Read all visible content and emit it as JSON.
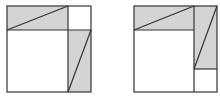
{
  "diagram": {
    "colors": {
      "stroke": "#333333",
      "shade": "#d4d4d4",
      "background": "#ffffff"
    },
    "figures": [
      {
        "name": "left-figure",
        "outer": {
          "x": 7,
          "y": 6,
          "w": 84,
          "h": 86
        },
        "shaded_rects": [
          {
            "x": 7,
            "y": 6,
            "w": 61,
            "h": 24
          },
          {
            "x": 68,
            "y": 30,
            "w": 23,
            "h": 62
          }
        ],
        "lines": [
          {
            "x1": 7,
            "y1": 30,
            "x2": 91,
            "y2": 30
          },
          {
            "x1": 68,
            "y1": 6,
            "x2": 68,
            "y2": 92
          },
          {
            "x1": 7,
            "y1": 30,
            "x2": 68,
            "y2": 6
          },
          {
            "x1": 68,
            "y1": 92,
            "x2": 91,
            "y2": 30
          }
        ]
      },
      {
        "name": "right-figure",
        "outer": {
          "x": 134,
          "y": 6,
          "w": 83,
          "h": 86
        },
        "shaded_rects": [
          {
            "x": 134,
            "y": 6,
            "w": 60,
            "h": 24
          },
          {
            "x": 194,
            "y": 6,
            "w": 23,
            "h": 63
          }
        ],
        "lines": [
          {
            "x1": 134,
            "y1": 30,
            "x2": 194,
            "y2": 30
          },
          {
            "x1": 194,
            "y1": 6,
            "x2": 194,
            "y2": 92
          },
          {
            "x1": 194,
            "y1": 69,
            "x2": 217,
            "y2": 69
          },
          {
            "x1": 134,
            "y1": 30,
            "x2": 194,
            "y2": 6
          },
          {
            "x1": 194,
            "y1": 69,
            "x2": 217,
            "y2": 6
          }
        ]
      }
    ]
  }
}
